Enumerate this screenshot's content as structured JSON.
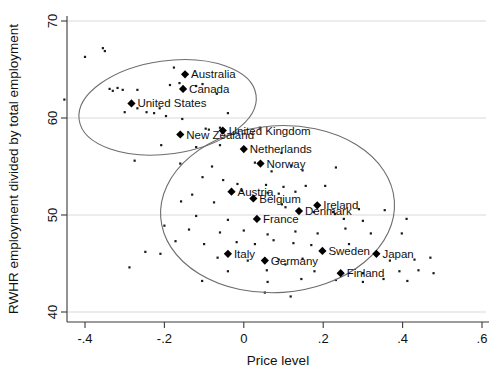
{
  "chart_data": {
    "type": "scatter",
    "title": "",
    "xlabel": "Price level",
    "ylabel": "RWHR employment divided by total employment",
    "xlim": [
      -0.5,
      0.6
    ],
    "ylim": [
      40,
      70
    ],
    "xticks": [
      -0.4,
      -0.2,
      0,
      0.2,
      0.4,
      0.6
    ],
    "xticklabels": [
      "-.4",
      "-.2",
      "0",
      ".2",
      ".4",
      ".6"
    ],
    "yticks": [
      40,
      50,
      60,
      70
    ],
    "yticklabels": [
      "40",
      "50",
      "60",
      "70"
    ],
    "grid": "horizontal",
    "legend": "none",
    "marker_style": "filled-diamond",
    "background_marker_style": "small-dot",
    "labeled_points": [
      {
        "label": "Australia",
        "x": -0.148,
        "y": 64.5
      },
      {
        "label": "Canada",
        "x": -0.153,
        "y": 63.0
      },
      {
        "label": "United States",
        "x": -0.283,
        "y": 61.5
      },
      {
        "label": "New Zealand",
        "x": -0.16,
        "y": 58.3
      },
      {
        "label": "United Kingdom",
        "x": -0.053,
        "y": 58.7
      },
      {
        "label": "Netherlands",
        "x": 0.0,
        "y": 56.8
      },
      {
        "label": "Norway",
        "x": 0.042,
        "y": 55.3
      },
      {
        "label": "Austria",
        "x": -0.031,
        "y": 52.4
      },
      {
        "label": "Belgium",
        "x": 0.024,
        "y": 51.7
      },
      {
        "label": "Ireland",
        "x": 0.185,
        "y": 51.0
      },
      {
        "label": "Denmark",
        "x": 0.139,
        "y": 50.4
      },
      {
        "label": "France",
        "x": 0.033,
        "y": 49.6
      },
      {
        "label": "Italy",
        "x": -0.04,
        "y": 46.0
      },
      {
        "label": "Germany",
        "x": 0.053,
        "y": 45.3
      },
      {
        "label": "Sweden",
        "x": 0.198,
        "y": 46.3
      },
      {
        "label": "Japan",
        "x": 0.334,
        "y": 46.0
      },
      {
        "label": "Finland",
        "x": 0.244,
        "y": 44.0
      }
    ],
    "background_points": [
      {
        "x": -0.4,
        "y": 66.3
      },
      {
        "x": -0.355,
        "y": 67.2
      },
      {
        "x": -0.35,
        "y": 66.9
      },
      {
        "x": -0.452,
        "y": 61.9
      },
      {
        "x": -0.338,
        "y": 63.0
      },
      {
        "x": -0.33,
        "y": 62.8
      },
      {
        "x": -0.318,
        "y": 63.1
      },
      {
        "x": -0.305,
        "y": 62.9
      },
      {
        "x": -0.268,
        "y": 62.9
      },
      {
        "x": -0.186,
        "y": 63.4
      },
      {
        "x": -0.176,
        "y": 65.2
      },
      {
        "x": -0.162,
        "y": 63.6
      },
      {
        "x": -0.12,
        "y": 63.3
      },
      {
        "x": -0.104,
        "y": 63.5
      },
      {
        "x": -0.068,
        "y": 62.5
      },
      {
        "x": -0.3,
        "y": 60.6
      },
      {
        "x": -0.268,
        "y": 61.0
      },
      {
        "x": -0.245,
        "y": 60.6
      },
      {
        "x": -0.226,
        "y": 60.5
      },
      {
        "x": -0.212,
        "y": 61.0
      },
      {
        "x": -0.196,
        "y": 60.2
      },
      {
        "x": -0.155,
        "y": 59.9
      },
      {
        "x": -0.04,
        "y": 60.5
      },
      {
        "x": -0.06,
        "y": 59.0
      },
      {
        "x": -0.088,
        "y": 58.8
      },
      {
        "x": -0.096,
        "y": 58.9
      },
      {
        "x": 0.04,
        "y": 59.0
      },
      {
        "x": -0.208,
        "y": 57.2
      },
      {
        "x": -0.12,
        "y": 57.0
      },
      {
        "x": -0.06,
        "y": 57.2
      },
      {
        "x": -0.275,
        "y": 55.6
      },
      {
        "x": -0.16,
        "y": 55.3
      },
      {
        "x": -0.08,
        "y": 55.0
      },
      {
        "x": 0.095,
        "y": 56.4
      },
      {
        "x": 0.028,
        "y": 55.4
      },
      {
        "x": 0.07,
        "y": 54.5
      },
      {
        "x": 0.12,
        "y": 55.1
      },
      {
        "x": 0.148,
        "y": 54.6
      },
      {
        "x": 0.232,
        "y": 54.9
      },
      {
        "x": -0.104,
        "y": 53.9
      },
      {
        "x": -0.052,
        "y": 53.6
      },
      {
        "x": -0.016,
        "y": 53.2
      },
      {
        "x": 0.056,
        "y": 53.1
      },
      {
        "x": 0.1,
        "y": 52.9
      },
      {
        "x": 0.156,
        "y": 53.0
      },
      {
        "x": -0.13,
        "y": 52.1
      },
      {
        "x": -0.005,
        "y": 52.5
      },
      {
        "x": 0.06,
        "y": 52.3
      },
      {
        "x": 0.088,
        "y": 52.2
      },
      {
        "x": 0.13,
        "y": 52.4
      },
      {
        "x": 0.205,
        "y": 53.0
      },
      {
        "x": -0.158,
        "y": 51.4
      },
      {
        "x": -0.075,
        "y": 51.3
      },
      {
        "x": 0.096,
        "y": 51.1
      },
      {
        "x": 0.105,
        "y": 50.8
      },
      {
        "x": 0.176,
        "y": 50.3
      },
      {
        "x": 0.225,
        "y": 50.3
      },
      {
        "x": 0.23,
        "y": 50.1
      },
      {
        "x": 0.29,
        "y": 50.6
      },
      {
        "x": 0.355,
        "y": 50.5
      },
      {
        "x": -0.12,
        "y": 49.9
      },
      {
        "x": -0.04,
        "y": 49.5
      },
      {
        "x": 0.252,
        "y": 49.6
      },
      {
        "x": 0.3,
        "y": 49.4
      },
      {
        "x": 0.41,
        "y": 49.6
      },
      {
        "x": -0.2,
        "y": 48.9
      },
      {
        "x": -0.138,
        "y": 48.5
      },
      {
        "x": -0.06,
        "y": 48.2
      },
      {
        "x": 0.0,
        "y": 48.4
      },
      {
        "x": 0.06,
        "y": 48.0
      },
      {
        "x": 0.13,
        "y": 48.3
      },
      {
        "x": 0.186,
        "y": 48.1
      },
      {
        "x": 0.256,
        "y": 48.6
      },
      {
        "x": 0.32,
        "y": 48.1
      },
      {
        "x": 0.398,
        "y": 48.1
      },
      {
        "x": -0.172,
        "y": 47.3
      },
      {
        "x": -0.1,
        "y": 47.0
      },
      {
        "x": -0.018,
        "y": 47.2
      },
      {
        "x": 0.028,
        "y": 47.0
      },
      {
        "x": 0.075,
        "y": 47.4
      },
      {
        "x": 0.125,
        "y": 47.1
      },
      {
        "x": 0.17,
        "y": 46.9
      },
      {
        "x": 0.265,
        "y": 47.0
      },
      {
        "x": -0.248,
        "y": 46.2
      },
      {
        "x": -0.21,
        "y": 46.0
      },
      {
        "x": -0.066,
        "y": 45.6
      },
      {
        "x": 0.01,
        "y": 45.3
      },
      {
        "x": 0.088,
        "y": 45.4
      },
      {
        "x": 0.105,
        "y": 44.9
      },
      {
        "x": 0.148,
        "y": 45.5
      },
      {
        "x": 0.368,
        "y": 45.3
      },
      {
        "x": 0.43,
        "y": 45.4
      },
      {
        "x": 0.47,
        "y": 45.6
      },
      {
        "x": -0.288,
        "y": 44.6
      },
      {
        "x": -0.04,
        "y": 44.2
      },
      {
        "x": 0.058,
        "y": 44.3
      },
      {
        "x": 0.178,
        "y": 44.2
      },
      {
        "x": 0.3,
        "y": 44.0
      },
      {
        "x": 0.392,
        "y": 44.2
      },
      {
        "x": 0.44,
        "y": 44.3
      },
      {
        "x": 0.478,
        "y": 44.0
      },
      {
        "x": -0.105,
        "y": 43.2
      },
      {
        "x": 0.06,
        "y": 43.1
      },
      {
        "x": 0.145,
        "y": 43.4
      },
      {
        "x": 0.232,
        "y": 43.3
      },
      {
        "x": 0.3,
        "y": 43.1
      },
      {
        "x": 0.352,
        "y": 43.4
      },
      {
        "x": 0.412,
        "y": 43.2
      },
      {
        "x": 0.053,
        "y": 42.0
      },
      {
        "x": 0.118,
        "y": 41.6
      }
    ],
    "ellipses": [
      {
        "name": "anglo-cluster-ellipse",
        "cx": -0.192,
        "cy": 61.1,
        "rx": 0.225,
        "ry": 4.8,
        "rotation": -8
      },
      {
        "name": "continental-cluster-ellipse",
        "cx": 0.085,
        "cy": 50.6,
        "rx": 0.295,
        "ry": 8.6,
        "rotation": -4
      }
    ]
  }
}
